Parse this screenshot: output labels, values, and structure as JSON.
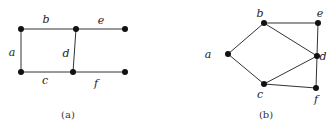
{
  "figure": {
    "panels": [
      {
        "caption": "(a)",
        "caption_pos": [
          68,
          118
        ],
        "type": "graph-edge-labels",
        "vertices": [
          {
            "id": "v1",
            "x": 21,
            "y": 29
          },
          {
            "id": "v2",
            "x": 76,
            "y": 29
          },
          {
            "id": "v3",
            "x": 125,
            "y": 29
          },
          {
            "id": "v4",
            "x": 21,
            "y": 72
          },
          {
            "id": "v5",
            "x": 73,
            "y": 72
          },
          {
            "id": "v6",
            "x": 125,
            "y": 72
          }
        ],
        "edges": [
          {
            "label": "b",
            "from": "v1",
            "to": "v2",
            "label_pos": [
              46,
              23
            ]
          },
          {
            "label": "e",
            "from": "v2",
            "to": "v3",
            "label_pos": [
              101,
              24
            ]
          },
          {
            "label": "a",
            "from": "v1",
            "to": "v4",
            "label_pos": [
              12,
              56
            ]
          },
          {
            "label": "d",
            "from": "v2",
            "to": "v5",
            "label_pos": [
              66,
              57
            ]
          },
          {
            "label": "c",
            "from": "v4",
            "to": "v5",
            "label_pos": [
              45,
              84
            ]
          },
          {
            "label": "f",
            "from": "v5",
            "to": "v6",
            "label_pos": [
              96,
              87
            ]
          }
        ]
      },
      {
        "caption": "(b)",
        "caption_pos": [
          266,
          118
        ],
        "type": "graph-vertex-labels",
        "vertices": [
          {
            "id": "a",
            "label": "a",
            "x": 228,
            "y": 54,
            "label_pos": [
              208,
              58
            ]
          },
          {
            "id": "b",
            "label": "b",
            "x": 264,
            "y": 23,
            "label_pos": [
              260,
              17
            ]
          },
          {
            "id": "e",
            "label": "e",
            "x": 318,
            "y": 23,
            "label_pos": [
              320,
              17
            ]
          },
          {
            "id": "d",
            "label": "d",
            "x": 317,
            "y": 56,
            "label_pos": [
              323,
              60
            ]
          },
          {
            "id": "c",
            "label": "c",
            "x": 264,
            "y": 84,
            "label_pos": [
              260,
              98
            ]
          },
          {
            "id": "f",
            "label": "f",
            "x": 316,
            "y": 88,
            "label_pos": [
              316,
              103
            ]
          }
        ],
        "edges": [
          [
            "a",
            "b"
          ],
          [
            "a",
            "c"
          ],
          [
            "b",
            "e"
          ],
          [
            "b",
            "d"
          ],
          [
            "e",
            "d"
          ],
          [
            "c",
            "d"
          ],
          [
            "c",
            "f"
          ],
          [
            "d",
            "f"
          ]
        ]
      }
    ]
  }
}
